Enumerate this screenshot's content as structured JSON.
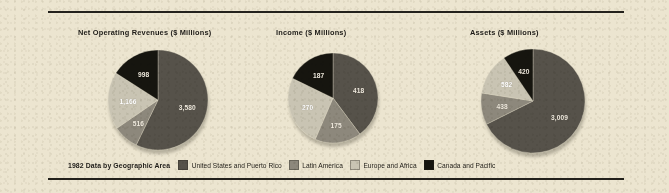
{
  "background_color": "#ece5d0",
  "rule_color": "#23211c",
  "palette": {
    "united_states_and_puerto_rico": "#56524a",
    "latin_america": "#8d887c",
    "europe_and_africa": "#c9c4b3",
    "canada_and_pacific": "#16150f"
  },
  "legend": {
    "title": "1982 Data by Geographic Area",
    "items": [
      {
        "label": "United States and Puerto Rico",
        "color": "#56524a"
      },
      {
        "label": "Latin America",
        "color": "#8d887c"
      },
      {
        "label": "Europe and Africa",
        "color": "#c9c4b3"
      },
      {
        "label": "Canada and Pacific",
        "color": "#16150f"
      }
    ]
  },
  "chart_data": [
    {
      "type": "pie",
      "title": "Net Operating Revenues ($ Millions)",
      "xlabel": "",
      "ylabel": "",
      "legend_position": "bottom-shared",
      "categories": [
        "United States and Puerto Rico",
        "Latin America",
        "Europe and Africa",
        "Canada and Pacific"
      ],
      "values": [
        3580,
        516,
        1166,
        998
      ],
      "labels": [
        "3,580",
        "516",
        "1,166",
        "998"
      ],
      "colors": [
        "#56524a",
        "#8d887c",
        "#c9c4b3",
        "#16150f"
      ],
      "total": 6260,
      "units": "$ Millions"
    },
    {
      "type": "pie",
      "title": "Income ($ Millions)",
      "xlabel": "",
      "ylabel": "",
      "legend_position": "bottom-shared",
      "categories": [
        "United States and Puerto Rico",
        "Latin America",
        "Europe and Africa",
        "Canada and Pacific"
      ],
      "values": [
        418,
        175,
        270,
        187
      ],
      "labels": [
        "418",
        "175",
        "270",
        "187"
      ],
      "colors": [
        "#56524a",
        "#8d887c",
        "#c9c4b3",
        "#16150f"
      ],
      "total": 1050,
      "units": "$ Millions"
    },
    {
      "type": "pie",
      "title": "Assets ($ Millions)",
      "xlabel": "",
      "ylabel": "",
      "legend_position": "bottom-shared",
      "categories": [
        "United States and Puerto Rico",
        "Latin America",
        "Europe and Africa",
        "Canada and Pacific"
      ],
      "values": [
        3009,
        438,
        582,
        420
      ],
      "labels": [
        "3,009",
        "438",
        "582",
        "420"
      ],
      "colors": [
        "#56524a",
        "#8d887c",
        "#c9c4b3",
        "#16150f"
      ],
      "total": 4449,
      "units": "$ Millions"
    }
  ],
  "charts_layout": [
    {
      "title_x": 78,
      "title_y": 28,
      "cx": 158,
      "cy": 100,
      "r": 50
    },
    {
      "title_x": 276,
      "title_y": 28,
      "cx": 333,
      "cy": 98,
      "r": 45
    },
    {
      "title_x": 470,
      "title_y": 28,
      "cx": 533,
      "cy": 101,
      "r": 52
    }
  ]
}
